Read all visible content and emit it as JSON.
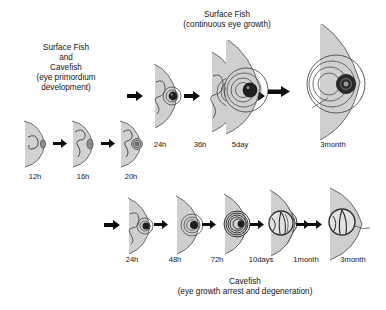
{
  "figure": {
    "title_top": "Surface Fish\n(continuous eye growth)",
    "title_left": "Surface Fish\nand\nCavefish\n(eye primordium\ndevelopment)",
    "title_bottom": "Cavefish\n(eye growth arrest and degeneration)",
    "colors": {
      "head_fill": "#d2d2d2",
      "head_shade": "#b4b4b4",
      "outline": "#3c3c3c",
      "lens_dark": "#232323",
      "arrow": "#0d0d0d",
      "background": "#ffffff",
      "text": "#141414"
    }
  },
  "rows": {
    "embryo": {
      "name": "eye primordium development",
      "stages": [
        {
          "id": "embryo-12h",
          "label": "12h"
        },
        {
          "id": "embryo-16h",
          "label": "16h"
        },
        {
          "id": "embryo-20h",
          "label": "20h"
        }
      ]
    },
    "surface": {
      "name": "surface fish continuous eye growth",
      "stages": [
        {
          "id": "surface-24h",
          "label": "24h"
        },
        {
          "id": "surface-36h",
          "label": "36h"
        },
        {
          "id": "surface-5day",
          "label": "5day"
        },
        {
          "id": "surface-3month",
          "label": "3month"
        }
      ]
    },
    "cavefish": {
      "name": "cavefish eye growth arrest and degeneration",
      "stages": [
        {
          "id": "cave-24h",
          "label": "24h"
        },
        {
          "id": "cave-48h",
          "label": "48h"
        },
        {
          "id": "cave-72h",
          "label": "72h"
        },
        {
          "id": "cave-10days",
          "label": "10days"
        },
        {
          "id": "cave-1month",
          "label": "1month"
        },
        {
          "id": "cave-3month",
          "label": "3month"
        }
      ]
    }
  }
}
